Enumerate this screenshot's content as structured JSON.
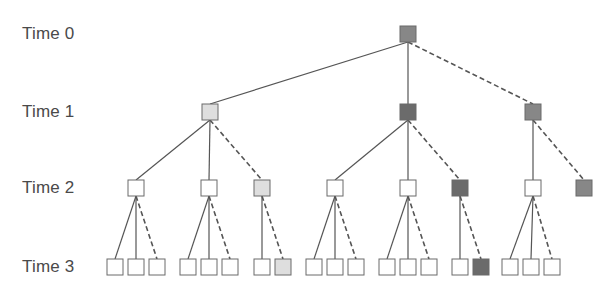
{
  "labels": [
    {
      "text": "Time 0",
      "y": 34
    },
    {
      "text": "Time 1",
      "y": 112
    },
    {
      "text": "Time 2",
      "y": 188
    },
    {
      "text": "Time 3",
      "y": 267
    }
  ],
  "colors": {
    "white": "#ffffff",
    "light": "#dedede",
    "medium": "#878787",
    "dark": "#6b6b6b",
    "stroke": "#6a6a6a",
    "edge": "#555555"
  },
  "node_size": 16,
  "nodes": [
    {
      "id": "t0",
      "x": 408,
      "y": 34,
      "fill": "medium",
      "level": 0
    },
    {
      "id": "t1a",
      "x": 210,
      "y": 112,
      "fill": "light",
      "level": 1
    },
    {
      "id": "t1b",
      "x": 408,
      "y": 112,
      "fill": "dark",
      "level": 1
    },
    {
      "id": "t1c",
      "x": 533,
      "y": 112,
      "fill": "medium",
      "level": 1
    },
    {
      "id": "t2a",
      "x": 136,
      "y": 188,
      "fill": "white",
      "level": 2
    },
    {
      "id": "t2b",
      "x": 209,
      "y": 188,
      "fill": "white",
      "level": 2
    },
    {
      "id": "t2c",
      "x": 262,
      "y": 188,
      "fill": "light",
      "level": 2
    },
    {
      "id": "t2d",
      "x": 335,
      "y": 188,
      "fill": "white",
      "level": 2
    },
    {
      "id": "t2e",
      "x": 408,
      "y": 188,
      "fill": "white",
      "level": 2
    },
    {
      "id": "t2f",
      "x": 460,
      "y": 188,
      "fill": "dark",
      "level": 2
    },
    {
      "id": "t2g",
      "x": 533,
      "y": 188,
      "fill": "white",
      "level": 2
    },
    {
      "id": "t2h",
      "x": 584,
      "y": 188,
      "fill": "medium",
      "level": 2
    },
    {
      "id": "t3a1",
      "x": 115,
      "y": 267,
      "fill": "white",
      "level": 3
    },
    {
      "id": "t3a2",
      "x": 136,
      "y": 267,
      "fill": "white",
      "level": 3
    },
    {
      "id": "t3a3",
      "x": 157,
      "y": 267,
      "fill": "white",
      "level": 3
    },
    {
      "id": "t3b1",
      "x": 188,
      "y": 267,
      "fill": "white",
      "level": 3
    },
    {
      "id": "t3b2",
      "x": 209,
      "y": 267,
      "fill": "white",
      "level": 3
    },
    {
      "id": "t3b3",
      "x": 230,
      "y": 267,
      "fill": "white",
      "level": 3
    },
    {
      "id": "t3c1",
      "x": 262,
      "y": 267,
      "fill": "white",
      "level": 3
    },
    {
      "id": "t3c2",
      "x": 283,
      "y": 267,
      "fill": "light",
      "level": 3
    },
    {
      "id": "t3d1",
      "x": 314,
      "y": 267,
      "fill": "white",
      "level": 3
    },
    {
      "id": "t3d2",
      "x": 335,
      "y": 267,
      "fill": "white",
      "level": 3
    },
    {
      "id": "t3d3",
      "x": 356,
      "y": 267,
      "fill": "white",
      "level": 3
    },
    {
      "id": "t3e1",
      "x": 387,
      "y": 267,
      "fill": "white",
      "level": 3
    },
    {
      "id": "t3e2",
      "x": 408,
      "y": 267,
      "fill": "white",
      "level": 3
    },
    {
      "id": "t3e3",
      "x": 429,
      "y": 267,
      "fill": "white",
      "level": 3
    },
    {
      "id": "t3f1",
      "x": 460,
      "y": 267,
      "fill": "white",
      "level": 3
    },
    {
      "id": "t3f2",
      "x": 481,
      "y": 267,
      "fill": "dark",
      "level": 3
    },
    {
      "id": "t3g1",
      "x": 510,
      "y": 267,
      "fill": "white",
      "level": 3
    },
    {
      "id": "t3g2",
      "x": 531,
      "y": 267,
      "fill": "white",
      "level": 3
    },
    {
      "id": "t3g3",
      "x": 552,
      "y": 267,
      "fill": "white",
      "level": 3
    }
  ],
  "edges": [
    {
      "from": "t0",
      "to": "t1a",
      "style": "solid"
    },
    {
      "from": "t0",
      "to": "t1b",
      "style": "solid"
    },
    {
      "from": "t0",
      "to": "t1c",
      "style": "dashed"
    },
    {
      "from": "t1a",
      "to": "t2a",
      "style": "solid"
    },
    {
      "from": "t1a",
      "to": "t2b",
      "style": "solid"
    },
    {
      "from": "t1a",
      "to": "t2c",
      "style": "dashed"
    },
    {
      "from": "t1b",
      "to": "t2d",
      "style": "solid"
    },
    {
      "from": "t1b",
      "to": "t2e",
      "style": "solid"
    },
    {
      "from": "t1b",
      "to": "t2f",
      "style": "dashed"
    },
    {
      "from": "t1c",
      "to": "t2g",
      "style": "solid"
    },
    {
      "from": "t1c",
      "to": "t2h",
      "style": "dashed"
    },
    {
      "from": "t2a",
      "to": "t3a1",
      "style": "solid"
    },
    {
      "from": "t2a",
      "to": "t3a2",
      "style": "solid"
    },
    {
      "from": "t2a",
      "to": "t3a3",
      "style": "dashed"
    },
    {
      "from": "t2b",
      "to": "t3b1",
      "style": "solid"
    },
    {
      "from": "t2b",
      "to": "t3b2",
      "style": "solid"
    },
    {
      "from": "t2b",
      "to": "t3b3",
      "style": "dashed"
    },
    {
      "from": "t2c",
      "to": "t3c1",
      "style": "solid"
    },
    {
      "from": "t2c",
      "to": "t3c2",
      "style": "dashed"
    },
    {
      "from": "t2d",
      "to": "t3d1",
      "style": "solid"
    },
    {
      "from": "t2d",
      "to": "t3d2",
      "style": "solid"
    },
    {
      "from": "t2d",
      "to": "t3d3",
      "style": "dashed"
    },
    {
      "from": "t2e",
      "to": "t3e1",
      "style": "solid"
    },
    {
      "from": "t2e",
      "to": "t3e2",
      "style": "solid"
    },
    {
      "from": "t2e",
      "to": "t3e3",
      "style": "dashed"
    },
    {
      "from": "t2f",
      "to": "t3f1",
      "style": "solid"
    },
    {
      "from": "t2f",
      "to": "t3f2",
      "style": "dashed"
    },
    {
      "from": "t2g",
      "to": "t3g1",
      "style": "solid"
    },
    {
      "from": "t2g",
      "to": "t3g2",
      "style": "solid"
    },
    {
      "from": "t2g",
      "to": "t3g3",
      "style": "dashed"
    }
  ]
}
